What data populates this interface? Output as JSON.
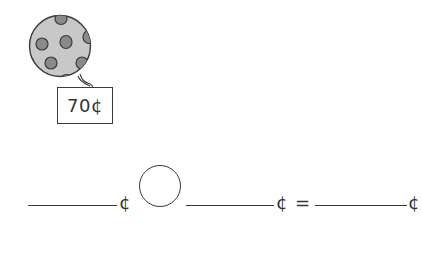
{
  "picture": {
    "item": "ball",
    "item_icon": "polka-dot-ball-icon",
    "price_tag": {
      "amount": "70",
      "unit": "¢",
      "label": "70¢"
    }
  },
  "equation": {
    "blank1_unit": "¢",
    "operator_placeholder": "",
    "blank2_unit": "¢",
    "equals": "=",
    "result_unit": "¢"
  },
  "colors": {
    "ball_fill": "#c8c8c8",
    "spot_fill": "#8a8a8a",
    "stroke": "#3a3a3a"
  }
}
